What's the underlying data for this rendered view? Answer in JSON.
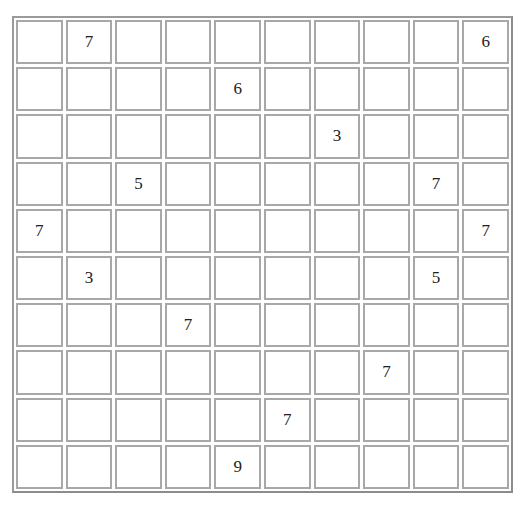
{
  "puzzle": {
    "rows": 10,
    "cols": 10,
    "grid": [
      [
        "",
        "7",
        "",
        "",
        "",
        "",
        "",
        "",
        "",
        "6"
      ],
      [
        "",
        "",
        "",
        "",
        "6",
        "",
        "",
        "",
        "",
        ""
      ],
      [
        "",
        "",
        "",
        "",
        "",
        "",
        "3",
        "",
        "",
        ""
      ],
      [
        "",
        "",
        "5",
        "",
        "",
        "",
        "",
        "",
        "7",
        ""
      ],
      [
        "7",
        "",
        "",
        "",
        "",
        "",
        "",
        "",
        "",
        "7"
      ],
      [
        "",
        "3",
        "",
        "",
        "",
        "",
        "",
        "",
        "5",
        ""
      ],
      [
        "",
        "",
        "",
        "7",
        "",
        "",
        "",
        "",
        "",
        ""
      ],
      [
        "",
        "",
        "",
        "",
        "",
        "",
        "",
        "7",
        "",
        ""
      ],
      [
        "",
        "",
        "",
        "",
        "",
        "7",
        "",
        "",
        "",
        ""
      ],
      [
        "",
        "",
        "",
        "",
        "9",
        "",
        "",
        "",
        "",
        ""
      ]
    ]
  },
  "colors": {
    "cell_border": "#a8a8a8",
    "frame_border": "#9a9a9a",
    "text": "#222222",
    "background": "#ffffff"
  }
}
